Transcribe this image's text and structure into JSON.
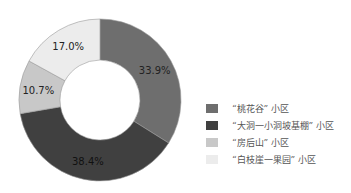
{
  "chart_data": {
    "type": "pie",
    "subtype": "donut",
    "title": "",
    "categories": [
      "“桃花谷” 小区",
      "“大洞一小洞坡基棚” 小区",
      "“房后山” 小区",
      "“白枝崖一果园” 小区"
    ],
    "values": [
      33.9,
      38.4,
      10.7,
      17.0
    ],
    "value_labels": [
      "33.9%",
      "38.4%",
      "10.7%",
      "17.0%"
    ],
    "colors": [
      "#6e6e6e",
      "#404040",
      "#c8c8c8",
      "#ececec"
    ],
    "legend_position": "right",
    "start_angle": "top, clockwise"
  },
  "legend": [
    {
      "label": "“桃花谷” 小区",
      "color": "#6e6e6e"
    },
    {
      "label": "“大洞一小洞坡基棚” 小区",
      "color": "#404040"
    },
    {
      "label": "“房后山” 小区",
      "color": "#c8c8c8"
    },
    {
      "label": "“白枝崖一果园” 小区",
      "color": "#ececec"
    }
  ],
  "labels": {
    "l0": "33.9%",
    "l1": "38.4%",
    "l2": "10.7%",
    "l3": "17.0%"
  }
}
